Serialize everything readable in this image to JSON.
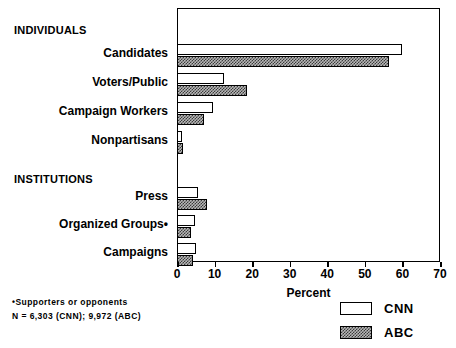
{
  "chart_data": {
    "type": "bar",
    "orientation": "horizontal",
    "title": "",
    "xlabel": "Percent",
    "ylabel": "",
    "xlim": [
      0,
      70
    ],
    "xticks": [
      0,
      10,
      20,
      30,
      40,
      50,
      60,
      70
    ],
    "grid": false,
    "legend_position": "bottom-right",
    "group_headings": [
      "INDIVIDUALS",
      "INSTITUTIONS"
    ],
    "categories": [
      "Candidates",
      "Voters/Public",
      "Campaign Workers",
      "Nonpartisans",
      "Press",
      "Organized Groups•",
      "Campaigns"
    ],
    "series": [
      {
        "name": "CNN",
        "values": [
          60.0,
          12.5,
          9.5,
          1.2,
          5.5,
          4.8,
          5.0
        ]
      },
      {
        "name": "ABC",
        "values": [
          56.5,
          18.5,
          7.3,
          1.5,
          8.0,
          3.7,
          4.3
        ]
      }
    ],
    "annotations": [
      "•Supporters or opponents",
      "N = 6,303 (CNN); 9,972 (ABC)"
    ]
  },
  "axis": {
    "x_title": "Percent",
    "tick_labels": [
      "0",
      "10",
      "20",
      "30",
      "40",
      "50",
      "60",
      "70"
    ]
  },
  "groups": {
    "individuals": "INDIVIDUALS",
    "institutions": "INSTITUTIONS"
  },
  "labels": {
    "candidates": "Candidates",
    "voters_public": "Voters/Public",
    "campaign_workers": "Campaign Workers",
    "nonpartisans": "Nonpartisans",
    "press": "Press",
    "organized_groups": "Organized Groups•",
    "campaigns": "Campaigns"
  },
  "legend": {
    "cnn": "CNN",
    "abc": "ABC"
  },
  "footnote": {
    "line1": "•Supporters or opponents",
    "line2": "N = 6,303 (CNN); 9,972 (ABC)"
  },
  "colors": {
    "axis": "#000000",
    "cnn_fill": "#ffffff",
    "abc_fill": "#b7b7b7",
    "background": "#ffffff"
  }
}
